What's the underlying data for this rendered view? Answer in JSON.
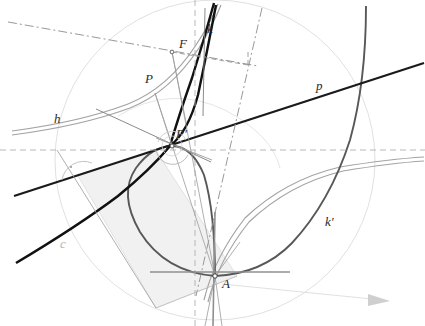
{
  "figure": {
    "width": 425,
    "height": 326,
    "background": "#ffffff"
  },
  "labels": [
    {
      "id": "k",
      "text": "k",
      "x": 207,
      "y": 33,
      "style": "dark",
      "size": 13
    },
    {
      "id": "F",
      "text": "F",
      "x": 179,
      "y": 48,
      "style": "dark",
      "size": 13
    },
    {
      "id": "P",
      "text": "P",
      "x": 145,
      "y": 83,
      "style": "dark",
      "size": 13
    },
    {
      "id": "p",
      "text": "p",
      "x": 316,
      "y": 90,
      "style": "dark",
      "size": 13
    },
    {
      "id": "h",
      "text": "h",
      "x": 54,
      "y": 123,
      "style": "dark",
      "size": 13
    },
    {
      "id": "Pp",
      "text": "P'",
      "x": 176,
      "y": 138,
      "style": "dark",
      "size": 13
    },
    {
      "id": "kp",
      "text": "k'",
      "x": 325,
      "y": 226,
      "style": "dark",
      "size": 13
    },
    {
      "id": "c",
      "text": "c",
      "x": 60,
      "y": 248,
      "style": "faint",
      "size": 13
    },
    {
      "id": "A",
      "text": "A",
      "x": 222,
      "y": 288,
      "style": "dark",
      "size": 13
    }
  ],
  "points": [
    {
      "id": "F",
      "x": 172,
      "y": 52,
      "name": "focus-point-F"
    },
    {
      "id": "P",
      "x": 155,
      "y": 93,
      "name": "point-P"
    },
    {
      "id": "P'",
      "x": 172,
      "y": 146,
      "name": "point-P-prime"
    },
    {
      "id": "A",
      "x": 215,
      "y": 276,
      "name": "cusp-point-A"
    }
  ],
  "colors": {
    "curve_k": "#111111",
    "curve_k_prime": "#565656",
    "curve_h": "#9a9a9a",
    "circle_c": "#d8d8d8",
    "line_p": "#1a1a1a",
    "dashed": "#aaaaaa",
    "dashdot": "#8a8a8a",
    "thin_gray": "#9a9a9a",
    "shade_fill": "#f0f0f0",
    "shade_stroke": "#cfcfcf",
    "axis_gray": "#8f8f8f",
    "arrow": "#cccccc"
  },
  "elements": {
    "shaded_quadrilateral": "light gray filled parallelogram",
    "right_angle_marker": "small dot inside semicircular angle arc at left",
    "angle_arc": "semicircle arc marking angle at intersection on line p",
    "arrow_marker": "light gray arrow pointing right near bottom-right",
    "vertical_dashed_axis": "vertical dashed line through x=195",
    "horizontal_dashed_axis": "horizontal dashed line through y=150"
  }
}
